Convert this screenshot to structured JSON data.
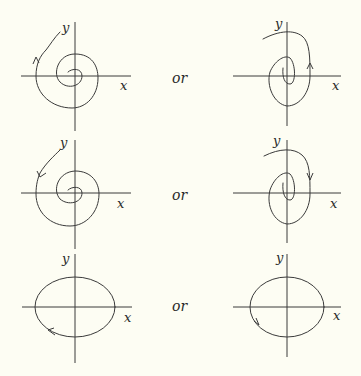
{
  "figure": {
    "background": "#fdfdf3",
    "ink": "#3a3a3a",
    "separator_word": "or",
    "rows": [
      {
        "name": "unstable-spiral-row",
        "left": {
          "x_label": "x",
          "y_label": "y",
          "curve": "spiral-outward",
          "direction": "counterclockwise"
        },
        "or": "or",
        "right": {
          "x_label": "x",
          "y_label": "y",
          "curve": "spiral-outward",
          "direction": "counterclockwise"
        }
      },
      {
        "name": "stable-spiral-row",
        "left": {
          "x_label": "x",
          "y_label": "y",
          "curve": "spiral-inward",
          "direction": "counterclockwise"
        },
        "or": "or",
        "right": {
          "x_label": "x",
          "y_label": "y",
          "curve": "spiral-inward",
          "direction": "clockwise"
        }
      },
      {
        "name": "center-row",
        "left": {
          "x_label": "x",
          "y_label": "y",
          "curve": "ellipse",
          "direction": "counterclockwise"
        },
        "or": "or",
        "right": {
          "x_label": "x",
          "y_label": "y",
          "curve": "ellipse",
          "direction": "clockwise"
        }
      }
    ]
  }
}
